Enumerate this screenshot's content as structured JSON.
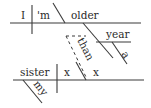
{
  "diagram": {
    "type": "sentence-diagram",
    "sentence_words": {
      "subject": "I",
      "verb": "'m",
      "predicate_adjective": "older",
      "modifier_noun": "year",
      "article": "a",
      "conjunction": "than",
      "clause_subject": "sister",
      "clause_verb": "x",
      "clause_complement": "x",
      "possessive": "my"
    },
    "line_color": "#3a3a3a",
    "text_color": "#2a2a2a"
  }
}
